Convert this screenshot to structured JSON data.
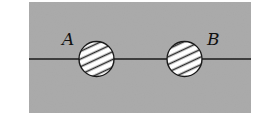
{
  "diagram": {
    "background_color": "#a8a8a8",
    "page_color": "#ffffff",
    "line_color": "#1a1a1a",
    "circle_fill": "#ffffff",
    "hatch_color": "#2a2a2a",
    "region": {
      "x": 29,
      "y": 2,
      "width": 222,
      "height": 111
    },
    "line": {
      "y": 59,
      "x1": 29,
      "x2": 251
    },
    "points": [
      {
        "label": "A",
        "cx": 96.5,
        "cy": 59,
        "r": 18,
        "label_x": 62,
        "label_y": 32
      },
      {
        "label": "B",
        "cx": 184.5,
        "cy": 59,
        "r": 18,
        "label_x": 207,
        "label_y": 32
      }
    ]
  }
}
